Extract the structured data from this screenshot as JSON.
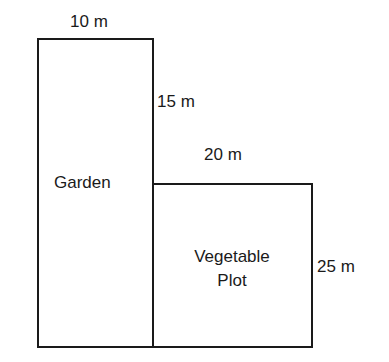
{
  "diagram": {
    "regions": [
      {
        "name": "Garden",
        "width_label": "10 m",
        "height_label": "15 m"
      },
      {
        "name": "Vegetable Plot",
        "line1": "Vegetable",
        "line2": "Plot",
        "width_label": "20 m",
        "height_label": "25 m"
      }
    ],
    "colors": {
      "line": "#1a1a1a",
      "background": "#ffffff",
      "text": "#1a1a1a"
    }
  }
}
